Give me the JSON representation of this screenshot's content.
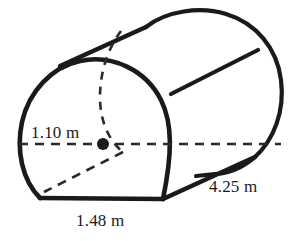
{
  "figure": {
    "type": "geometry-diagram",
    "stroke_color": "#1a1a1a",
    "background_color": "#ffffff",
    "labels": {
      "radius": "1.10 m",
      "width": "1.48 m",
      "length": "4.25 m"
    },
    "dimensions": [
      {
        "name": "radius",
        "value": "1.10 m",
        "role": "radius from center to left edge of circular face"
      },
      {
        "name": "width",
        "value": "1.48 m",
        "role": "flat bottom chord width of front face"
      },
      {
        "name": "length",
        "value": "4.25 m",
        "role": "length of the solid along the bottom slant edge"
      }
    ],
    "center_marker": "center-dot"
  }
}
